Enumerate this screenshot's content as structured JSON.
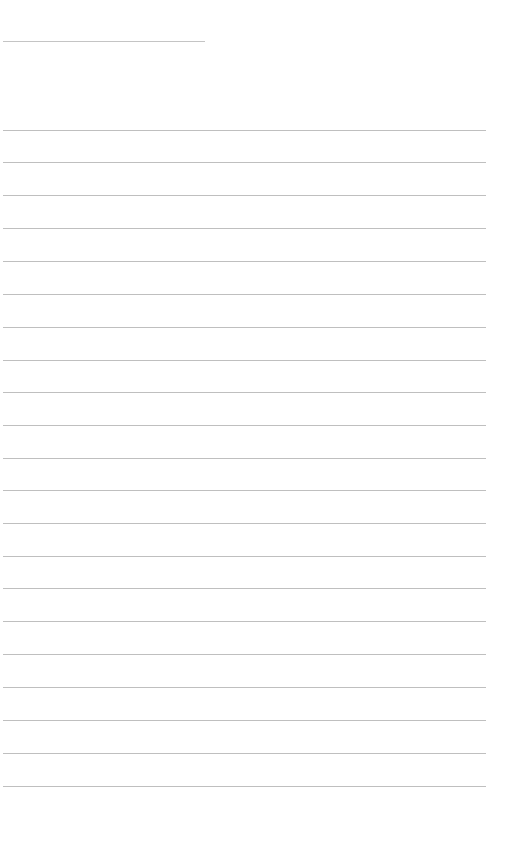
{
  "page": {
    "type": "blank-lined-sheet",
    "background_color": "#ffffff",
    "line_color": "#bfbfbf"
  },
  "header_line": {
    "x": 3,
    "y": 41,
    "width": 202
  },
  "ruled_lines": {
    "count": 21,
    "x": 3,
    "width": 483,
    "y_positions": [
      130,
      162,
      195,
      228,
      261,
      294,
      327,
      360,
      392,
      425,
      458,
      490,
      523,
      556,
      588,
      621,
      654,
      687,
      720,
      753,
      786
    ]
  }
}
